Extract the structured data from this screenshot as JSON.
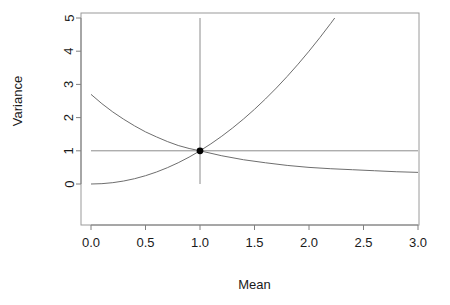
{
  "chart_data": {
    "type": "line",
    "title": "",
    "subtitle": "",
    "xlabel": "Mean",
    "ylabel": "Variance",
    "xlim": [
      -0.09,
      3.09
    ],
    "ylim": [
      -0.18,
      5.18
    ],
    "xticks": [
      0.0,
      0.5,
      1.0,
      1.5,
      2.0,
      2.5,
      3.0
    ],
    "xtick_labels": [
      "0.0",
      "0.5",
      "1.0",
      "1.5",
      "2.0",
      "2.5",
      "3.0"
    ],
    "yticks": [
      0,
      1,
      2,
      3,
      4,
      5
    ],
    "ytick_labels": [
      "0",
      "1",
      "2",
      "3",
      "4",
      "5"
    ],
    "grid": false,
    "legend": "none",
    "box": true,
    "series": [
      {
        "name": "quadratic-variance",
        "note": "rising curve, variance = mean^2, clipped at variance = 5",
        "x": [
          0.0,
          0.1,
          0.2,
          0.3,
          0.4,
          0.5,
          0.6,
          0.7,
          0.8,
          0.9,
          1.0,
          1.1,
          1.2,
          1.3,
          1.4,
          1.5,
          1.6,
          1.7,
          1.8,
          1.9,
          2.0,
          2.1,
          2.2,
          2.236
        ],
        "y": [
          0.0,
          0.01,
          0.04,
          0.09,
          0.16,
          0.25,
          0.36,
          0.49,
          0.64,
          0.81,
          1.0,
          1.21,
          1.44,
          1.69,
          1.96,
          2.25,
          2.56,
          2.89,
          3.24,
          3.61,
          4.0,
          4.41,
          4.84,
          5.0
        ]
      },
      {
        "name": "inverse-variance",
        "note": "declining curve, starts near variance 2.7 at mean 0 and decays toward 0.35 at mean 3",
        "x": [
          0.0,
          0.1,
          0.2,
          0.3,
          0.4,
          0.5,
          0.6,
          0.7,
          0.8,
          0.9,
          1.0,
          1.2,
          1.4,
          1.6,
          1.8,
          2.0,
          2.2,
          2.4,
          2.6,
          2.8,
          3.0
        ],
        "y": [
          2.7,
          2.42,
          2.17,
          1.95,
          1.75,
          1.57,
          1.42,
          1.28,
          1.16,
          1.07,
          1.0,
          0.85,
          0.73,
          0.64,
          0.56,
          0.5,
          0.46,
          0.43,
          0.4,
          0.37,
          0.35
        ]
      },
      {
        "name": "constant-variance",
        "note": "horizontal reference line, variance = 1 for all means",
        "x": [
          0.0,
          3.0
        ],
        "y": [
          1.0,
          1.0
        ]
      },
      {
        "name": "mean-reference",
        "note": "vertical reference line at mean = 1",
        "x": [
          1.0,
          1.0
        ],
        "y": [
          0.0,
          5.0
        ]
      }
    ],
    "annotations": [
      {
        "name": "crossing-point",
        "label": "",
        "x": 1.0,
        "y": 1.0,
        "marker": "filled-circle"
      }
    ],
    "colors": {
      "curve": "#6e6e6e",
      "reference_line": "#8c8c8c",
      "axis": "#808080",
      "box": "#9a9a9a",
      "point": "#000000",
      "text": "#1a1a1a",
      "background": "#ffffff"
    }
  }
}
